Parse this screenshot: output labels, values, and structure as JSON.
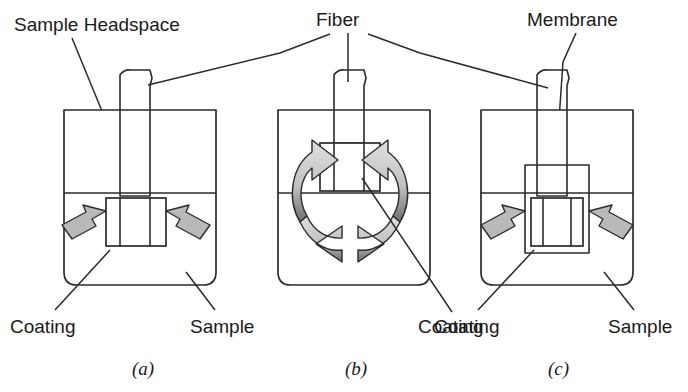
{
  "figure": {
    "background_color": "#ffffff",
    "line_color": "#2b2b2b",
    "arrow_fill_color": "#b9b9b9"
  },
  "labels": {
    "sample_headspace": "Sample Headspace",
    "fiber": "Fiber",
    "membrane": "Membrane",
    "coating_a": "Coating",
    "sample_a": "Sample",
    "coating_b": "Coating",
    "coating_c": "Coating",
    "sample_c": "Sample"
  },
  "panels": [
    {
      "id": "a",
      "letter": "(a)",
      "mode": "headspace-extraction",
      "has_stir_arrows": false,
      "has_diffusion_arrows": true,
      "has_membrane": false,
      "callouts": [
        "Sample Headspace",
        "Fiber",
        "Coating",
        "Sample"
      ]
    },
    {
      "id": "b",
      "letter": "(b)",
      "mode": "direct-immersion-with-stirring",
      "has_stir_arrows": true,
      "has_diffusion_arrows": false,
      "has_membrane": false,
      "callouts": [
        "Fiber",
        "Coating"
      ]
    },
    {
      "id": "c",
      "letter": "(c)",
      "mode": "membrane-protected-extraction",
      "has_stir_arrows": false,
      "has_diffusion_arrows": true,
      "has_membrane": true,
      "callouts": [
        "Fiber",
        "Membrane",
        "Coating",
        "Sample"
      ]
    }
  ]
}
